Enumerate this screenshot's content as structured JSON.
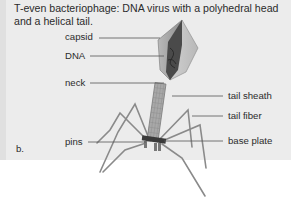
{
  "figure": {
    "caption": "T-even bacteriophage: DNA virus with a polyhedral head and a helical tail.",
    "panel_label": "b.",
    "labels": {
      "capsid": "capsid",
      "dna": "DNA",
      "neck": "neck",
      "tail_sheath": "tail sheath",
      "tail_fiber": "tail fiber",
      "pins": "pins",
      "base_plate": "base plate"
    },
    "colors": {
      "panel_background": "#ececec",
      "page_background": "#ffffff",
      "text": "#2b2b2b",
      "leader_line": "#555555"
    }
  }
}
